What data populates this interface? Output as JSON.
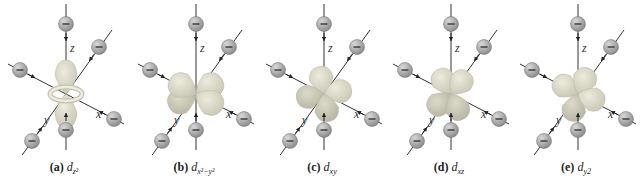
{
  "figure": {
    "panels": [
      {
        "tag": "(a)",
        "orbital": "d",
        "subscript": "z2",
        "subscript_display": "z²",
        "shape": "dz2"
      },
      {
        "tag": "(b)",
        "orbital": "d",
        "subscript": "x2−y2",
        "subscript_display": "x²−y²",
        "shape": "dx2y2"
      },
      {
        "tag": "(c)",
        "orbital": "d",
        "subscript": "xy",
        "subscript_display": "xy",
        "shape": "dxy"
      },
      {
        "tag": "(d)",
        "orbital": "d",
        "subscript": "xz",
        "subscript_display": "xz",
        "shape": "dxz"
      },
      {
        "tag": "(e)",
        "orbital": "d",
        "subscript": "y2",
        "subscript_display": "y2",
        "shape": "dyz"
      }
    ],
    "axes": {
      "x": "x",
      "y": "y",
      "z": "z"
    },
    "ligand_symbol": "−",
    "colors": {
      "lobe_light": "#ecebdc",
      "lobe_dark": "#c9c8b6",
      "sphere": "#8e8e8e",
      "sphere_highlight": "#d8d8d8",
      "axis": "#333333"
    }
  }
}
